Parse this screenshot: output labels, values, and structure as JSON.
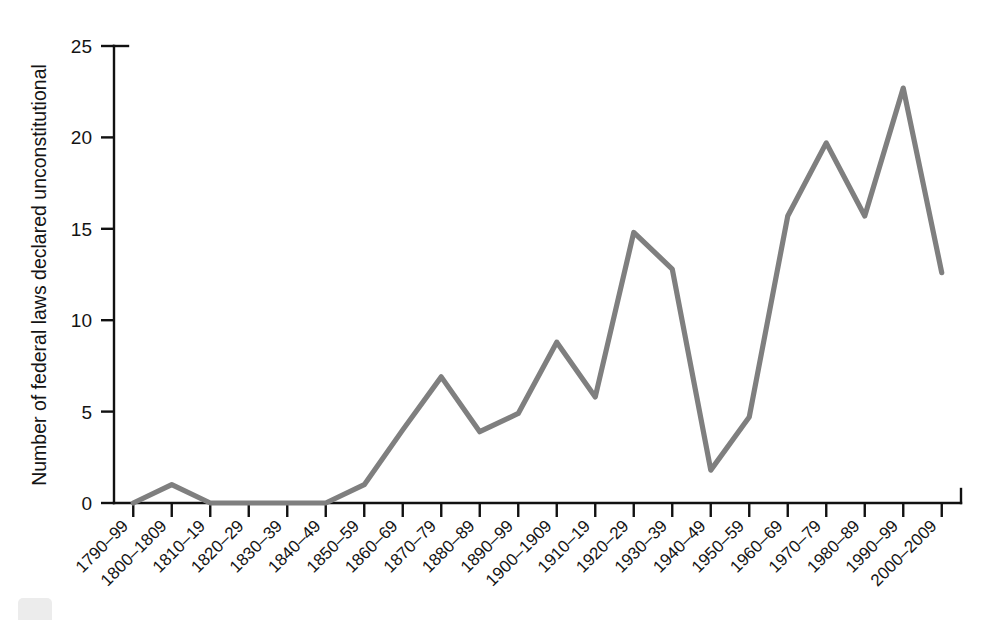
{
  "chart_data": {
    "type": "line",
    "title": "",
    "xlabel": "",
    "ylabel": "Number of federal laws declared unconstitutional",
    "categories": [
      "1790–99",
      "1800–1809",
      "1810–19",
      "1820–29",
      "1830–39",
      "1840–49",
      "1850–59",
      "1860–69",
      "1870–79",
      "1880–89",
      "1890–99",
      "1900–1909",
      "1910–19",
      "1920–29",
      "1930–39",
      "1940–49",
      "1950–59",
      "1960–69",
      "1970–79",
      "1980–89",
      "1990–99",
      "2000–2009"
    ],
    "values": [
      0,
      1.0,
      0,
      0,
      0,
      0,
      1.0,
      4.0,
      6.9,
      3.9,
      4.9,
      8.8,
      5.8,
      14.8,
      12.8,
      1.8,
      4.7,
      15.7,
      19.7,
      15.7,
      22.7,
      12.6
    ],
    "ylim": [
      0,
      25
    ],
    "yticks": [
      0,
      5,
      10,
      15,
      20,
      25
    ],
    "ytick_labels": [
      "0",
      "5",
      "10",
      "15",
      "20",
      "25"
    ],
    "grid": false,
    "legend": false,
    "legend_position": "none",
    "series_color": "#7f7f7f",
    "axis_color": "#111111",
    "background_color": "#ffffff",
    "xtick_rotation_deg": 45
  }
}
